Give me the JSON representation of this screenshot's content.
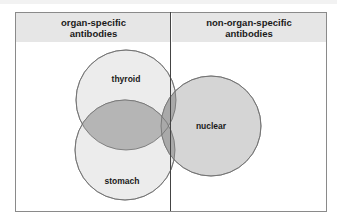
{
  "diagram": {
    "type": "venn",
    "columns": [
      {
        "id": "organ-specific",
        "title": "organ-specific antibodies",
        "line1": "organ-specific",
        "line2": "antibodies"
      },
      {
        "id": "non-organ-specific",
        "title": "non-organ-specific antibodies",
        "line1": "non-organ-specific",
        "line2": "antibodies"
      }
    ],
    "sets": [
      {
        "label": "thyroid",
        "group": "organ-specific"
      },
      {
        "label": "stomach",
        "group": "organ-specific"
      },
      {
        "label": "nuclear",
        "group": "non-organ-specific"
      }
    ],
    "overlaps": [
      [
        "thyroid",
        "stomach"
      ],
      [
        "thyroid",
        "nuclear"
      ],
      [
        "stomach",
        "nuclear"
      ],
      [
        "thyroid",
        "stomach",
        "nuclear"
      ]
    ],
    "colors": {
      "header_bg": "#e6e6e6",
      "light_circle": "#ececec",
      "nuclear_circle": "#d5d5d5",
      "overlap": "#b5b5b5",
      "border": "#555555"
    }
  }
}
